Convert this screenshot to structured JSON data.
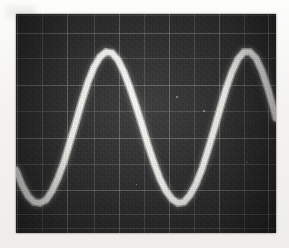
{
  "instrument": {
    "display_type": "oscilloscope-crt",
    "screen_label": "",
    "colors": {
      "screen_background": "#2b2b2b",
      "graticule_line": "#969696",
      "trace": "#fbfbf7",
      "photo_border": "#f2f1ef"
    }
  },
  "screen": {
    "x": 16,
    "y": 14,
    "width": 260,
    "height": 219,
    "graticule": {
      "visible": true,
      "divisions_horizontal": 10,
      "divisions_vertical": 8,
      "cell_px": 25,
      "vertical_lines_px": [
        1,
        26,
        51,
        78,
        103,
        128,
        153,
        178,
        203,
        228,
        252
      ],
      "horizontal_lines_px": [
        1,
        19,
        44,
        71,
        97,
        124,
        150,
        176,
        200,
        214
      ]
    }
  },
  "chart_data": {
    "type": "line",
    "title": "",
    "subtitle": "",
    "xlabel": "",
    "ylabel": "",
    "legend": [],
    "grid": true,
    "legend_position": "none",
    "annotations": [],
    "xlim": [
      0,
      260
    ],
    "ylim": [
      219,
      0
    ],
    "waveform": {
      "shape": "sine",
      "amplitude_px": 78,
      "period_px": 151,
      "midline_y_px": 119,
      "peak_y_px": 41,
      "trough_y_px": 197,
      "first_trough_x_px": 37,
      "first_peak_x_px": 115,
      "second_trough_x_px": 188,
      "second_peak_x_px": 266,
      "cycles_visible": 1.7,
      "trace_width_px": 5,
      "start_y_px": 170
    },
    "x": [
      0,
      6,
      12,
      18,
      24,
      30,
      36,
      42,
      48,
      54,
      60,
      66,
      72,
      78,
      84,
      90,
      96,
      102,
      108,
      114,
      120,
      126,
      132,
      138,
      144,
      150,
      156,
      162,
      168,
      174,
      180,
      186,
      192,
      198,
      204,
      210,
      216,
      222,
      228,
      234,
      240,
      246,
      252,
      258,
      260
    ],
    "values": [
      156,
      171,
      182,
      188,
      189,
      186,
      177,
      164,
      148,
      128,
      108,
      87,
      68,
      53,
      43,
      38,
      39,
      46,
      58,
      74,
      92,
      111,
      131,
      149,
      165,
      177,
      185,
      189,
      188,
      181,
      170,
      155,
      136,
      116,
      95,
      75,
      58,
      45,
      38,
      38,
      44,
      57,
      75,
      96,
      104
    ]
  },
  "photo": {
    "specks": [
      {
        "x": 160,
        "y": 82,
        "size": 2
      },
      {
        "x": 187,
        "y": 96,
        "size": 2
      },
      {
        "x": 74,
        "y": 52,
        "size": 1
      },
      {
        "x": 230,
        "y": 148,
        "size": 1
      },
      {
        "x": 120,
        "y": 170,
        "size": 1
      }
    ]
  }
}
